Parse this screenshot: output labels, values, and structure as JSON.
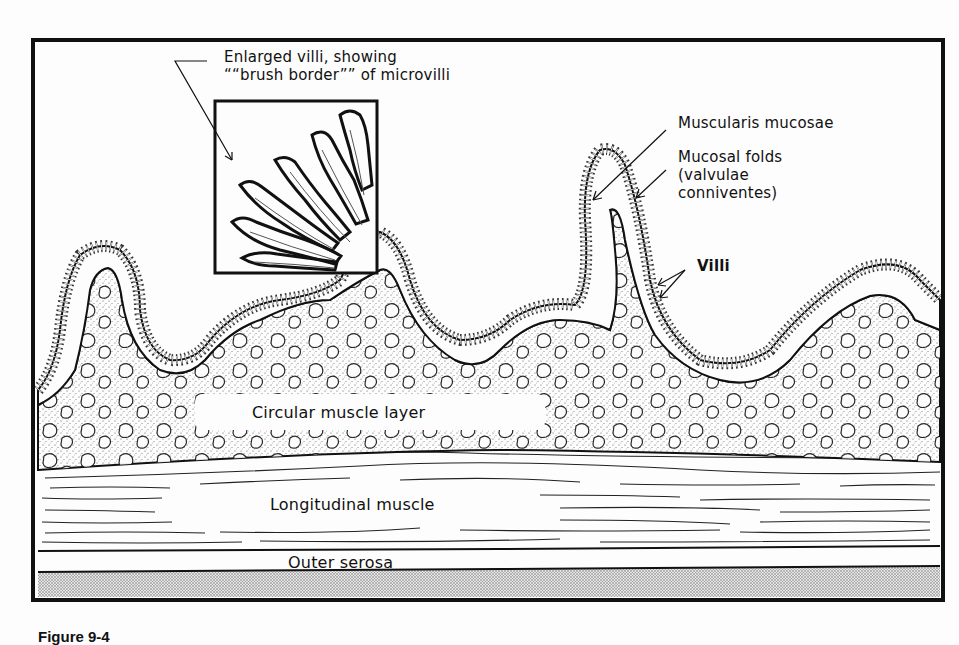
{
  "figure": {
    "caption": "Figure 9-4",
    "colors": {
      "ink": "#111111",
      "paper": "#fdfdfd",
      "stipple": "#888888"
    }
  },
  "labels": {
    "enlarged_villi_line1": "Enlarged villi, showing",
    "enlarged_villi_line2": "““brush border”” of microvilli",
    "muscularis_mucosae": "Muscularis mucosae",
    "mucosal_folds_line1": "Mucosal folds",
    "mucosal_folds_line2": "(valvulae",
    "mucosal_folds_line3": "conniventes)",
    "villi": "Villi",
    "circular_muscle": "Circular muscle layer",
    "longitudinal_muscle": "Longitudinal muscle",
    "outer_serosa": "Outer serosa"
  }
}
